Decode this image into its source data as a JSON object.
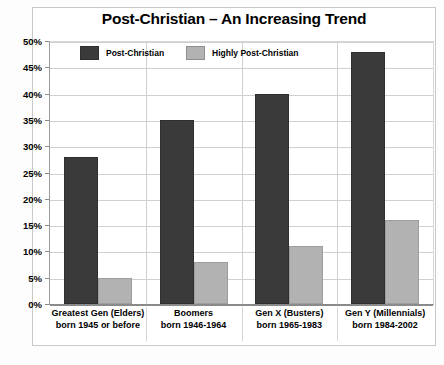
{
  "chart_data": {
    "type": "bar",
    "title": "Post-Christian – An Increasing Trend",
    "xlabel": "",
    "ylabel": "",
    "ylim": [
      0,
      50
    ],
    "ytick_labels": [
      "50%",
      "45%",
      "40%",
      "35%",
      "30%",
      "25%",
      "20%",
      "15%",
      "10%",
      "5%",
      "0%"
    ],
    "ytick_values": [
      50,
      45,
      40,
      35,
      30,
      25,
      20,
      15,
      10,
      5,
      0
    ],
    "grid": true,
    "legend_position": "top-inside",
    "categories": [
      "Greatest Gen (Elders) born 1945 or before",
      "Boomers born 1946-1964",
      "Gen X (Busters) born 1965-1983",
      "Gen Y (Millennials) born 1984-2002"
    ],
    "category_lines": [
      [
        "Greatest Gen (Elders)",
        "born 1945 or before"
      ],
      [
        "Boomers",
        "born 1946-1964"
      ],
      [
        "Gen X (Busters)",
        "born 1965-1983"
      ],
      [
        "Gen Y (Millennials)",
        "born 1984-2002"
      ]
    ],
    "series": [
      {
        "name": "Post-Christian",
        "color": "#3a3a3a",
        "values": [
          28,
          35,
          40,
          48
        ]
      },
      {
        "name": "Highly Post-Christian",
        "color": "#b2b2b2",
        "values": [
          5,
          8,
          11,
          16
        ]
      }
    ]
  },
  "legend": {
    "items": [
      {
        "label": "Post-Christian",
        "color": "#3a3a3a"
      },
      {
        "label": "Highly Post-Christian",
        "color": "#b2b2b2"
      }
    ]
  },
  "artifact": {
    "text": ""
  }
}
